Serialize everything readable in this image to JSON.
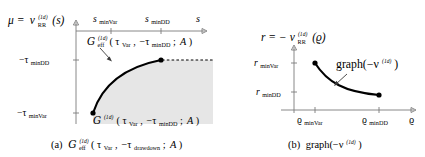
{
  "figure": {
    "background_color": "#ffffff",
    "region_fill": "#e6e6e6",
    "axis_color": "#7b7b7b",
    "curve_color": "#000000"
  },
  "panel_a": {
    "caption_prefix": "(a)",
    "caption_symbol": "G",
    "caption_sub": "eff",
    "caption_sup": "(1d)",
    "caption_args_open": "(",
    "caption_arg1": "τ",
    "caption_arg1_sub": "Var",
    "caption_comma": ",",
    "caption_arg2": "−τ",
    "caption_arg2_sub": "drawdown",
    "caption_semicolon": ";",
    "caption_arg3": "A",
    "caption_close": ")",
    "yaxis_label_lhs": "μ =",
    "yaxis_label_nu": "ν",
    "yaxis_label_nu_sub": "RR",
    "yaxis_label_nu_sup": "(1d)",
    "yaxis_label_arg": "(s)",
    "xaxis_label": "s",
    "xticks": [
      {
        "label_base": "s",
        "label_sub": "minVar"
      },
      {
        "label_base": "s",
        "label_sub": "minDD"
      }
    ],
    "yticks": [
      {
        "label_base": "−τ",
        "label_sub": "minDD"
      },
      {
        "label_base": "−τ",
        "label_sub": "minVar"
      }
    ],
    "curve_label": {
      "symbol": "G",
      "sub": "eff",
      "sup": "(1d)",
      "open": "(",
      "arg1": "τ",
      "arg1_sub": "Var",
      "comma": ",",
      "arg2": "−τ",
      "arg2_sub": "minDD",
      "semicolon": ";",
      "arg3": "A",
      "close": ")"
    },
    "region_label": {
      "symbol": "G",
      "sup": "(1d)",
      "open": "(",
      "arg1": "τ",
      "arg1_sub": "Var",
      "comma": ",",
      "arg2": "−τ",
      "arg2_sub": "minDD",
      "semicolon": ";",
      "arg3": "A",
      "close": ")"
    }
  },
  "panel_b": {
    "caption_prefix": "(b)",
    "caption_text": "graph(−ν",
    "caption_sup": "(1d)",
    "caption_close": ")",
    "yaxis_label_lhs": "r = −",
    "yaxis_label_nu": "ν",
    "yaxis_label_nu_sub": "RR",
    "yaxis_label_nu_sup": "(1d)",
    "yaxis_label_arg": "(ϱ)",
    "xaxis_label": "ϱ",
    "xticks": [
      {
        "label_base": "ϱ",
        "label_sub": "minVar"
      },
      {
        "label_base": "ϱ",
        "label_sub": "minDD"
      }
    ],
    "yticks": [
      {
        "label_base": "r",
        "label_sub": "minVar"
      },
      {
        "label_base": "r",
        "label_sub": "minDD"
      }
    ],
    "curve_label": {
      "text": "graph(−ν",
      "sup": "(1d)",
      "close": ")"
    }
  }
}
